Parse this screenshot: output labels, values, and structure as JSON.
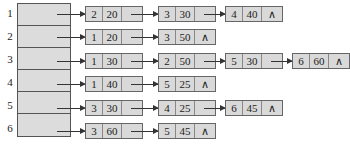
{
  "diagram": {
    "type": "adjacency-list",
    "vertices": [
      "1",
      "2",
      "3",
      "4",
      "5",
      "6"
    ],
    "null_symbol": "∧",
    "lists": [
      {
        "vertex": "1",
        "nodes": [
          {
            "adj": "2",
            "weight": "20"
          },
          {
            "adj": "3",
            "weight": "30"
          },
          {
            "adj": "4",
            "weight": "40"
          }
        ]
      },
      {
        "vertex": "2",
        "nodes": [
          {
            "adj": "1",
            "weight": "20"
          },
          {
            "adj": "3",
            "weight": "50"
          }
        ]
      },
      {
        "vertex": "3",
        "nodes": [
          {
            "adj": "1",
            "weight": "30"
          },
          {
            "adj": "2",
            "weight": "50"
          },
          {
            "adj": "5",
            "weight": "30"
          },
          {
            "adj": "6",
            "weight": "60"
          }
        ]
      },
      {
        "vertex": "4",
        "nodes": [
          {
            "adj": "1",
            "weight": "40"
          },
          {
            "adj": "5",
            "weight": "25"
          }
        ]
      },
      {
        "vertex": "5",
        "nodes": [
          {
            "adj": "3",
            "weight": "30"
          },
          {
            "adj": "4",
            "weight": "25"
          },
          {
            "adj": "6",
            "weight": "45"
          }
        ]
      },
      {
        "vertex": "6",
        "nodes": [
          {
            "adj": "3",
            "weight": "60"
          },
          {
            "adj": "5",
            "weight": "45"
          }
        ]
      }
    ]
  }
}
